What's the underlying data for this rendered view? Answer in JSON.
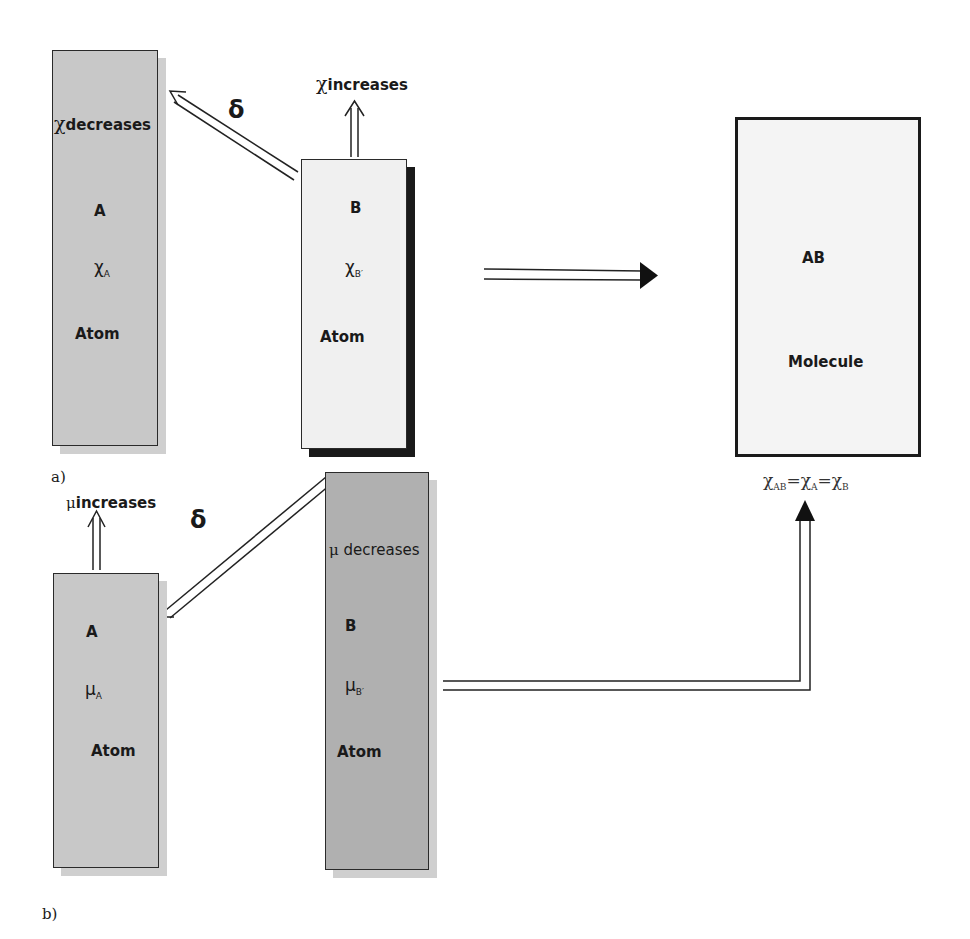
{
  "panel_a": {
    "label": "a)",
    "atom_a": {
      "name": "A",
      "symbol": "χ",
      "subscript": "A",
      "type": "Atom",
      "change_label": "decreases",
      "fill": "#c8c8c8"
    },
    "atom_b": {
      "name": "B",
      "symbol": "χ",
      "subscript": "B′",
      "type": "Atom",
      "change_label": "increases",
      "fill": "#f0f0f0"
    },
    "delta": "δ"
  },
  "panel_b": {
    "label": "b)",
    "atom_a": {
      "name": "A",
      "symbol": "μ",
      "subscript": "A",
      "type": "Atom",
      "change_label": "increases",
      "fill": "#c8c8c8"
    },
    "atom_b": {
      "name": "B",
      "symbol": "μ",
      "subscript": "B′",
      "type": "Atom",
      "change_label": "decreases",
      "fill": "#b0b0b0"
    },
    "delta": "δ"
  },
  "molecule": {
    "name": "AB",
    "type": "Molecule",
    "equation": {
      "sym": "χ",
      "sub1": "AB",
      "sub2": "A",
      "sub3": "B"
    },
    "fill": "#f4f4f4"
  }
}
